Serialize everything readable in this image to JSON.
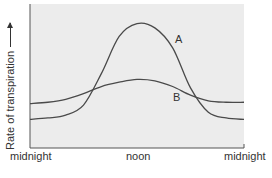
{
  "chart_data": {
    "type": "line",
    "title": "",
    "xlabel": "",
    "ylabel": "Rate of transpiration",
    "ylabel_arrow": true,
    "x_tick_labels": [
      "midnight",
      "noon",
      "midnight"
    ],
    "x": [
      0,
      2,
      4,
      6,
      8,
      10,
      12,
      14,
      16,
      18,
      20,
      22,
      24
    ],
    "x_unit": "hours since midnight",
    "ylim": [
      0,
      100
    ],
    "y_units": "relative (no numeric scale shown)",
    "grid": false,
    "legend": "inline labels",
    "background": "#ececec",
    "series": [
      {
        "name": "A",
        "label_position": {
          "x_hours": 18,
          "y": 78
        },
        "values": [
          20,
          21,
          23,
          30,
          52,
          78,
          87,
          84,
          70,
          42,
          25,
          21,
          20
        ]
      },
      {
        "name": "B",
        "label_position": {
          "x_hours": 18,
          "y": 36
        },
        "values": [
          31,
          32,
          34,
          38,
          43,
          46,
          48,
          47,
          43,
          37,
          33,
          32,
          32
        ]
      }
    ]
  },
  "labels": {
    "ylabel": "Rate of transpiration",
    "ticks": [
      "midnight",
      "noon",
      "midnight"
    ],
    "series_a": "A",
    "series_b": "B"
  },
  "colors": {
    "plot_bg": "#ececec",
    "line": "#4a4a4a",
    "axis": "#555555",
    "text": "#333333"
  }
}
